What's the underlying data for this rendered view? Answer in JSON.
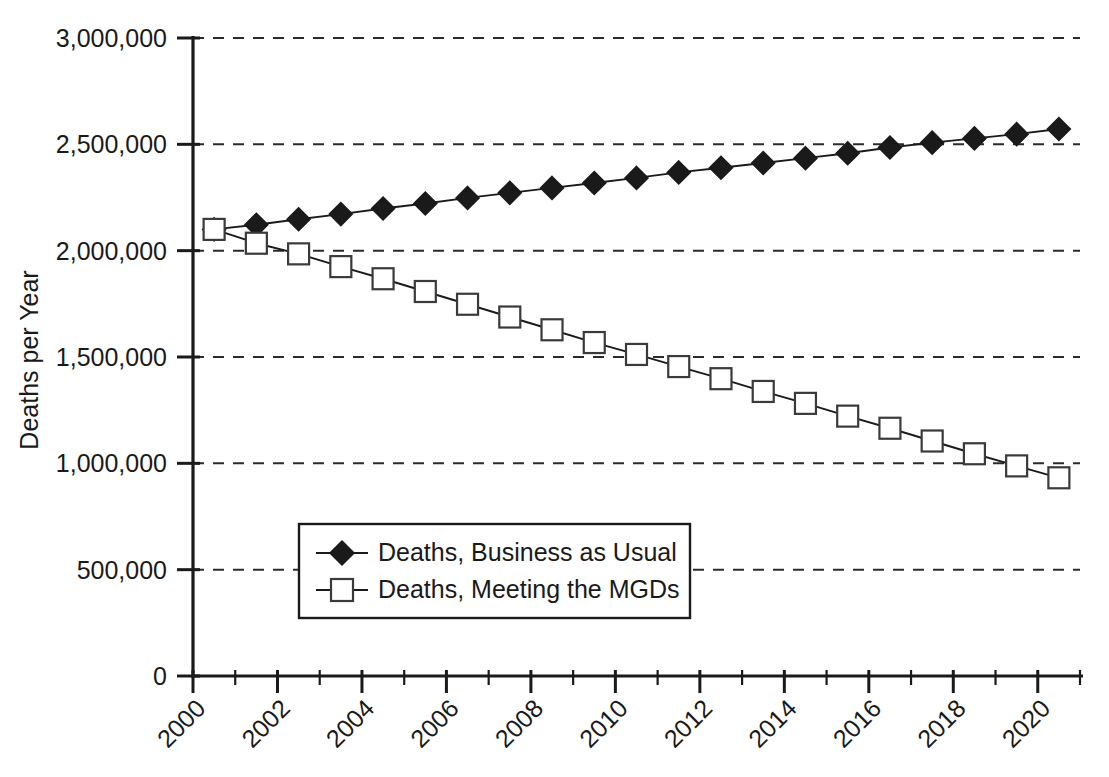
{
  "chart_data": {
    "type": "line",
    "title": "",
    "xlabel": "",
    "ylabel": "Deaths per Year",
    "xlim": [
      2000,
      2021
    ],
    "ylim": [
      0,
      3000000
    ],
    "grid": true,
    "legend_position": "center-left",
    "x": [
      2000,
      2001,
      2002,
      2003,
      2004,
      2005,
      2006,
      2007,
      2008,
      2009,
      2010,
      2011,
      2012,
      2013,
      2014,
      2015,
      2016,
      2017,
      2018,
      2019,
      2020
    ],
    "x_tick_labels": [
      "2000",
      "2002",
      "2004",
      "2006",
      "2008",
      "2010",
      "2012",
      "2014",
      "2016",
      "2018",
      "2020"
    ],
    "x_tick_values": [
      2000,
      2002,
      2004,
      2006,
      2008,
      2010,
      2012,
      2014,
      2016,
      2018,
      2020
    ],
    "y_tick_labels": [
      "0",
      "500,000",
      "1,000,000",
      "1,500,000",
      "2,000,000",
      "2,500,000",
      "3,000,000"
    ],
    "y_tick_values": [
      0,
      500000,
      1000000,
      1500000,
      2000000,
      2500000,
      3000000
    ],
    "series": [
      {
        "name": "Deaths, Business as Usual",
        "marker": "filled-diamond",
        "values": [
          2100000,
          2122000,
          2148000,
          2172000,
          2198000,
          2222000,
          2248000,
          2272000,
          2295000,
          2318000,
          2342000,
          2368000,
          2390000,
          2412000,
          2435000,
          2458000,
          2485000,
          2508000,
          2528000,
          2548000,
          2572000
        ]
      },
      {
        "name": "Deaths, Meeting the MGDs",
        "marker": "open-square",
        "values": [
          2100000,
          2035000,
          1985000,
          1925000,
          1868000,
          1808000,
          1748000,
          1688000,
          1628000,
          1568000,
          1512000,
          1455000,
          1398000,
          1338000,
          1282000,
          1222000,
          1165000,
          1105000,
          1045000,
          988000,
          932000
        ]
      }
    ]
  },
  "legend": {
    "items": [
      {
        "label": "Deaths, Business as Usual",
        "marker": "filled-diamond"
      },
      {
        "label": "Deaths, Meeting the MGDs",
        "marker": "open-square"
      }
    ]
  },
  "colors": {
    "ink": "#1a1a1a",
    "grid": "#2b2b2b",
    "background": "#ffffff",
    "marker_fill_open": "#ffffff"
  }
}
